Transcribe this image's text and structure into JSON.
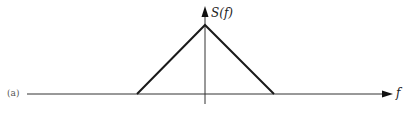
{
  "figure": {
    "panel_label": "(a)",
    "y_axis_label": "S(f)",
    "x_axis_label": "f"
  },
  "colors": {
    "line": "#1a1a1a",
    "axis": "#333333",
    "background": "#ffffff"
  },
  "geometry": {
    "axis_y": 94,
    "peak": [
      205,
      25
    ],
    "left_base": [
      137,
      94
    ],
    "right_base": [
      274,
      94
    ],
    "x_axis_start": 27,
    "x_axis_end": 393,
    "y_axis_top": 8,
    "y_axis_bottom": 104
  }
}
